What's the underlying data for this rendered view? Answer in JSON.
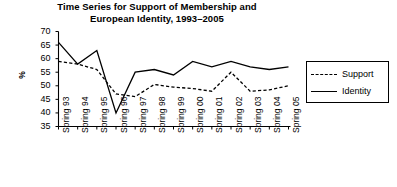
{
  "chart_data": {
    "type": "line",
    "title": "Time Series for Support of Membership and European Identity, 1993–2005",
    "title_lines": [
      "Time Series for Support of Membership and",
      "European Identity, 1993–2005"
    ],
    "xlabel": "",
    "ylabel": "%",
    "ylim": [
      35,
      70
    ],
    "yticks": [
      70,
      65,
      60,
      55,
      50,
      45,
      40,
      35
    ],
    "grid": false,
    "legend_position": "right",
    "categories": [
      "Spring 93",
      "Spring 94",
      "Spring 95",
      "Spring 96",
      "Spring 97",
      "Spring 98",
      "Spring 99",
      "Spring 00",
      "Spring 01",
      "Spring 02",
      "Spring 03",
      "Spring 04",
      "Spring 05"
    ],
    "series": [
      {
        "name": "Support",
        "style": "dashed",
        "color": "#000000",
        "values": [
          59,
          58,
          56,
          47,
          46,
          50.5,
          49.5,
          49,
          48,
          55,
          48,
          48.5,
          50
        ]
      },
      {
        "name": "Identity",
        "style": "solid",
        "color": "#000000",
        "values": [
          66,
          58,
          63,
          40,
          55,
          56,
          54,
          59,
          57,
          59,
          57,
          56,
          57
        ]
      }
    ]
  },
  "legend": {
    "items": [
      {
        "label": "Support",
        "style": "dashed"
      },
      {
        "label": "Identity",
        "style": "solid"
      }
    ]
  },
  "colors": {
    "axis": "#000000",
    "text": "#000000",
    "background": "#ffffff"
  }
}
